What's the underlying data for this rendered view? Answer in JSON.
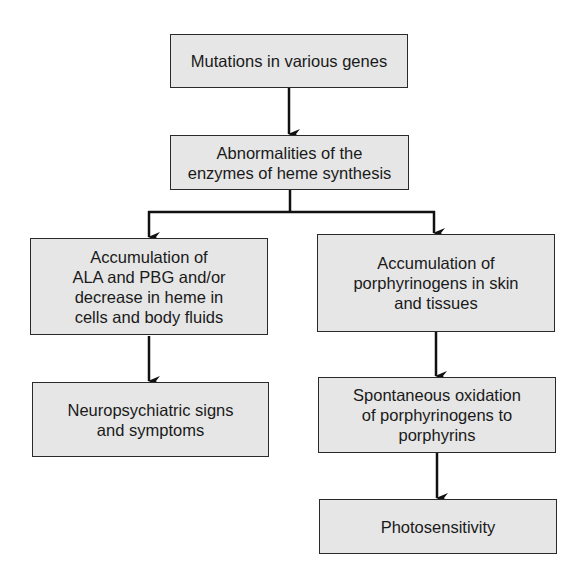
{
  "diagram": {
    "type": "flowchart",
    "nodes": [
      {
        "id": "mutations",
        "label": "Mutations in various genes"
      },
      {
        "id": "abnormalities",
        "label": "Abnormalities of the\nenzymes of heme synthesis"
      },
      {
        "id": "accumulation_ala",
        "label": "Accumulation of\nALA and PBG and/or\ndecrease in heme in\ncells and body fluids"
      },
      {
        "id": "accumulation_porphyrinogens",
        "label": "Accumulation of\nporphyrinogens in skin\nand tissues"
      },
      {
        "id": "neuropsychiatric",
        "label": "Neuropsychiatric signs\nand symptoms"
      },
      {
        "id": "oxidation",
        "label": "Spontaneous oxidation\nof porphyrinogens to\nporphyrins"
      },
      {
        "id": "photosensitivity",
        "label": "Photosensitivity"
      }
    ],
    "edges": [
      {
        "from": "mutations",
        "to": "abnormalities"
      },
      {
        "from": "abnormalities",
        "to": "accumulation_ala"
      },
      {
        "from": "abnormalities",
        "to": "accumulation_porphyrinogens"
      },
      {
        "from": "accumulation_ala",
        "to": "neuropsychiatric"
      },
      {
        "from": "accumulation_porphyrinogens",
        "to": "oxidation"
      },
      {
        "from": "oxidation",
        "to": "photosensitivity"
      }
    ],
    "colors": {
      "box_fill": "#e6e6e6",
      "border": "#2a2a2a",
      "arrow": "#111111"
    }
  }
}
